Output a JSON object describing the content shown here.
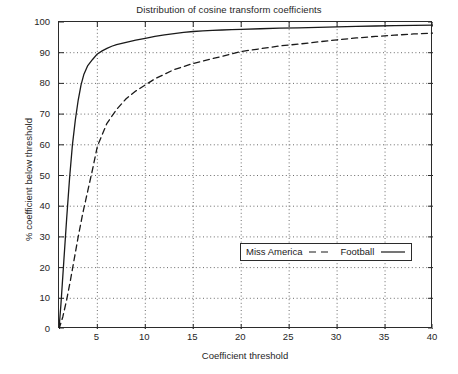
{
  "chart_data": {
    "type": "line",
    "title": "Distribution of cosine transform coefficients",
    "xlabel": "Coefficient threshold",
    "ylabel": "% coefficient below threshold",
    "xlim": [
      1,
      40
    ],
    "ylim": [
      0,
      100
    ],
    "grid": true,
    "grid_style": "dotted",
    "legend_position": "center-right-lower",
    "xticks": [
      5,
      10,
      15,
      20,
      25,
      30,
      35,
      40
    ],
    "yticks": [
      0,
      10,
      20,
      30,
      40,
      50,
      60,
      70,
      80,
      90,
      100
    ],
    "series": [
      {
        "name": "Miss America",
        "style": "dashed",
        "color": "#1a1a1a",
        "x": [
          1,
          1.4,
          1.8,
          2.2,
          2.6,
          3,
          3.5,
          4,
          4.5,
          5,
          6,
          7,
          8,
          9,
          10,
          11,
          12,
          13,
          14,
          15,
          16,
          17,
          18,
          19,
          20,
          22,
          24,
          26,
          28,
          30,
          32,
          34,
          36,
          38,
          40
        ],
        "y": [
          0,
          4,
          9.5,
          16,
          23,
          30,
          38,
          45,
          52,
          59.5,
          67,
          71.5,
          75,
          77.5,
          79.5,
          81.5,
          83,
          84.5,
          85.5,
          86.5,
          87.3,
          88.1,
          88.8,
          89.6,
          90.4,
          91.3,
          92.2,
          92.8,
          93.5,
          94.2,
          94.8,
          95.3,
          95.7,
          96.1,
          96.4
        ]
      },
      {
        "name": "Football",
        "style": "solid",
        "color": "#1a1a1a",
        "x": [
          1,
          1.2,
          1.5,
          1.8,
          2.1,
          2.4,
          2.7,
          3,
          3.3,
          3.6,
          4,
          4.5,
          5,
          5.5,
          6,
          6.5,
          7,
          8,
          9,
          10,
          11,
          12,
          13,
          14,
          15,
          16,
          17,
          18,
          19,
          20,
          22,
          24,
          26,
          28,
          30,
          32,
          34,
          36,
          38,
          40
        ],
        "y": [
          0,
          8,
          22,
          36,
          49,
          60,
          68,
          74.5,
          79.5,
          83,
          85.8,
          87.8,
          89.6,
          90.6,
          91.4,
          92.1,
          92.6,
          93.4,
          94.1,
          94.7,
          95.3,
          95.8,
          96.2,
          96.6,
          96.9,
          97.1,
          97.3,
          97.4,
          97.5,
          97.6,
          97.8,
          98,
          98.1,
          98.25,
          98.4,
          98.55,
          98.7,
          98.8,
          98.9,
          99
        ]
      }
    ]
  },
  "legend": {
    "entries": [
      {
        "label": "Miss America",
        "style": "dashed"
      },
      {
        "label": "Football",
        "style": "solid"
      }
    ]
  }
}
